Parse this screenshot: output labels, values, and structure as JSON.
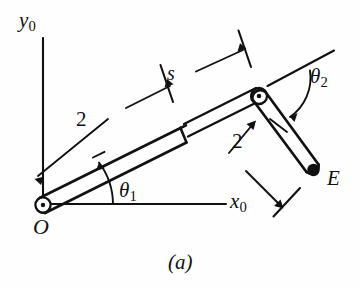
{
  "figure": {
    "caption": "(a)",
    "background_color": "#fefefe",
    "ink_color": "#111111",
    "labels": {
      "y_axis": "y",
      "y_axis_sub": "0",
      "x_axis": "x",
      "x_axis_sub": "0",
      "origin": "O",
      "endpoint": "E",
      "slide_variable": "s",
      "link1_length": "2",
      "link2_length": "2",
      "angle1": "θ",
      "angle1_sub": "1",
      "angle2": "θ",
      "angle2_sub": "2"
    },
    "icons": {
      "origin_joint": "revolute-joint-icon",
      "elbow_joint": "revolute-joint-icon",
      "end_effector": "end-point-icon",
      "prismatic_joint": "prismatic-joint-icon"
    },
    "geometry": {
      "origin_px": [
        43,
        205
      ],
      "elbow_px": [
        259,
        98
      ],
      "endpoint_px": [
        313,
        170
      ],
      "y_axis_top_px": [
        43,
        38
      ],
      "x_axis_end_px": [
        226,
        204
      ],
      "theta2_reference_end_px": [
        330,
        52
      ]
    }
  }
}
